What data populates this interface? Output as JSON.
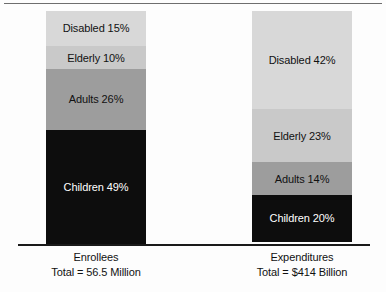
{
  "chart_data": {
    "type": "bar",
    "subtype": "stacked-100-percent",
    "title": "",
    "xlabel": "",
    "ylabel": "",
    "grid": false,
    "legend": "none",
    "ylim": [
      0,
      100
    ],
    "categories": [
      "Enrollees",
      "Expenditures"
    ],
    "category_totals": [
      "Total = 56.5 Million",
      "Total = $414 Billion"
    ],
    "series": [
      {
        "name": "Children",
        "values": [
          49,
          20
        ],
        "color": "#0d0d0d",
        "text_color": "#ffffff"
      },
      {
        "name": "Adults",
        "values": [
          26,
          14
        ],
        "color": "#9d9d9d",
        "text_color": "#111111"
      },
      {
        "name": "Elderly",
        "values": [
          10,
          23
        ],
        "color": "#c9c9c9",
        "text_color": "#111111"
      },
      {
        "name": "Disabled",
        "values": [
          15,
          42
        ],
        "color": "#d8d8d8",
        "text_color": "#111111"
      }
    ],
    "segment_labels": {
      "enrollees": {
        "disabled": "Disabled 15%",
        "elderly": "Elderly 10%",
        "adults": "Adults 26%",
        "children": "Children 49%"
      },
      "expenditures": {
        "disabled": "Disabled 42%",
        "elderly": "Elderly 23%",
        "adults": "Adults 14%",
        "children": "Children 20%"
      }
    }
  },
  "axis": {
    "enrollees": {
      "name": "Enrollees",
      "total": "Total = 56.5 Million"
    },
    "expenditures": {
      "name": "Expenditures",
      "total": "Total = $414 Billion"
    }
  },
  "colors": {
    "background": "#fdfdfd",
    "rule": "#6e6e6e",
    "baseline": "#1a1a1a",
    "children": "#0d0d0d",
    "adults": "#9d9d9d",
    "elderly": "#c9c9c9",
    "disabled": "#d8d8d8",
    "text_dark": "#111111",
    "text_light": "#ffffff"
  }
}
